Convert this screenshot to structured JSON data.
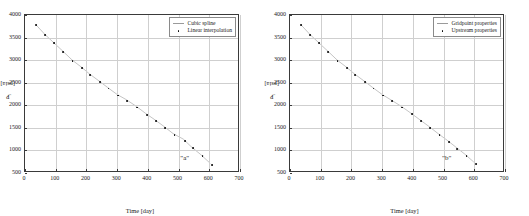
{
  "figure": {
    "background": "#ffffff",
    "axis_color": "#3a3a3a",
    "grid_color": "#cfcfcf",
    "marker_color": "#000000",
    "line_color": "#9a9a9a"
  },
  "chart_data": [
    {
      "type": "scatter",
      "panel": "left",
      "title": "",
      "xlabel": "Time [day]",
      "ylabel_main": "P",
      "ylabel_sub": "i",
      "ylabel_unit": "[psia]",
      "ylabel": "P_i [psia]",
      "xlim": [
        0,
        700
      ],
      "ylim": [
        500,
        4000
      ],
      "xticks": [
        0,
        100,
        200,
        300,
        400,
        500,
        600,
        700
      ],
      "xticklabels": [
        "0",
        "100",
        "200",
        "300",
        "400",
        "500",
        "600",
        "700"
      ],
      "yticks": [
        500,
        1000,
        1500,
        2000,
        2500,
        3000,
        3500,
        4000
      ],
      "yticklabels": [
        "500",
        "1000",
        "1500",
        "2000",
        "2500",
        "3000",
        "3500",
        "4000"
      ],
      "grid": true,
      "legend_position": "top-right",
      "annotation": {
        "text": "\"a\"",
        "x": 520,
        "y": 830
      },
      "series": [
        {
          "name": "Cubic spline",
          "style": "line",
          "color": "#9a9a9a",
          "x": [
            35,
            65,
            95,
            125,
            155,
            185,
            212,
            243,
            272,
            303,
            333,
            366,
            397,
            427,
            457,
            487,
            521,
            546,
            578,
            610
          ],
          "y": [
            3780,
            3560,
            3370,
            3180,
            2985,
            2830,
            2675,
            2520,
            2370,
            2215,
            2100,
            1950,
            1790,
            1650,
            1500,
            1340,
            1215,
            1050,
            870,
            670
          ]
        },
        {
          "name": "Linear interpolation",
          "style": "marker",
          "color": "#000000",
          "x": [
            35,
            65,
            95,
            125,
            155,
            185,
            212,
            243,
            272,
            303,
            333,
            366,
            397,
            427,
            457,
            487,
            521,
            546,
            578,
            610
          ],
          "y": [
            3780,
            3560,
            3370,
            3180,
            2985,
            2830,
            2675,
            2520,
            2370,
            2215,
            2100,
            1950,
            1790,
            1650,
            1500,
            1340,
            1215,
            1050,
            870,
            670
          ]
        }
      ]
    },
    {
      "type": "scatter",
      "panel": "right",
      "title": "",
      "xlabel": "Time [day]",
      "ylabel_main": "P",
      "ylabel_sub": "i",
      "ylabel_unit": "[psia]",
      "ylabel": "P_i [psia]",
      "xlim": [
        0,
        700
      ],
      "ylim": [
        500,
        4000
      ],
      "xticks": [
        0,
        100,
        200,
        300,
        400,
        500,
        600,
        700
      ],
      "xticklabels": [
        "0",
        "100",
        "200",
        "300",
        "400",
        "500",
        "600",
        "700"
      ],
      "yticks": [
        500,
        1000,
        1500,
        2000,
        2500,
        3000,
        3500,
        4000
      ],
      "yticklabels": [
        "500",
        "1000",
        "1500",
        "2000",
        "2500",
        "3000",
        "3500",
        "4000"
      ],
      "grid": true,
      "legend_position": "top-right",
      "annotation": {
        "text": "\"b\"",
        "x": 510,
        "y": 830
      },
      "series": [
        {
          "name": "Gridpoint properties",
          "style": "line",
          "color": "#9a9a9a",
          "x": [
            35,
            65,
            95,
            125,
            155,
            185,
            212,
            243,
            272,
            303,
            333,
            366,
            397,
            427,
            457,
            487,
            517,
            545,
            575,
            605
          ],
          "y": [
            3780,
            3560,
            3370,
            3180,
            2985,
            2830,
            2675,
            2520,
            2370,
            2215,
            2090,
            1950,
            1800,
            1650,
            1500,
            1340,
            1190,
            1040,
            880,
            700
          ]
        },
        {
          "name": "Upstream properties",
          "style": "marker",
          "color": "#000000",
          "x": [
            35,
            65,
            95,
            125,
            155,
            185,
            212,
            243,
            272,
            303,
            333,
            366,
            397,
            427,
            457,
            487,
            517,
            545,
            575,
            605
          ],
          "y": [
            3780,
            3560,
            3370,
            3180,
            2985,
            2830,
            2675,
            2520,
            2370,
            2215,
            2090,
            1950,
            1800,
            1650,
            1500,
            1340,
            1190,
            1040,
            880,
            700
          ]
        }
      ]
    }
  ]
}
